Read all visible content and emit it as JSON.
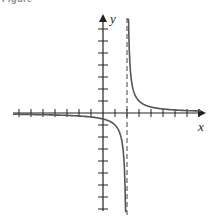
{
  "caption": "Figure",
  "chart_data": {
    "type": "line",
    "title": "",
    "function": "y = 1/(x - 2)",
    "xlabel": "x",
    "ylabel": "y",
    "vertical_asymptote": 2,
    "horizontal_asymptote": 0,
    "xlim": [
      -7.5,
      8.4
    ],
    "ylim": [
      -8,
      8
    ],
    "x_ticks": [
      -7,
      -6,
      -5,
      -4,
      -3,
      -2,
      -1,
      1,
      2,
      3,
      4,
      5,
      6,
      7,
      8
    ],
    "y_ticks": [
      -8,
      -7,
      -6,
      -5,
      -4,
      -3,
      -2,
      -1,
      1,
      2,
      3,
      4,
      5,
      6,
      7
    ],
    "grid": false,
    "legend": null
  },
  "axes": {
    "x_label": "x",
    "y_label": "y"
  },
  "colors": {
    "curve": "#555555",
    "axis": "#222222",
    "asymptote": "#444444"
  }
}
